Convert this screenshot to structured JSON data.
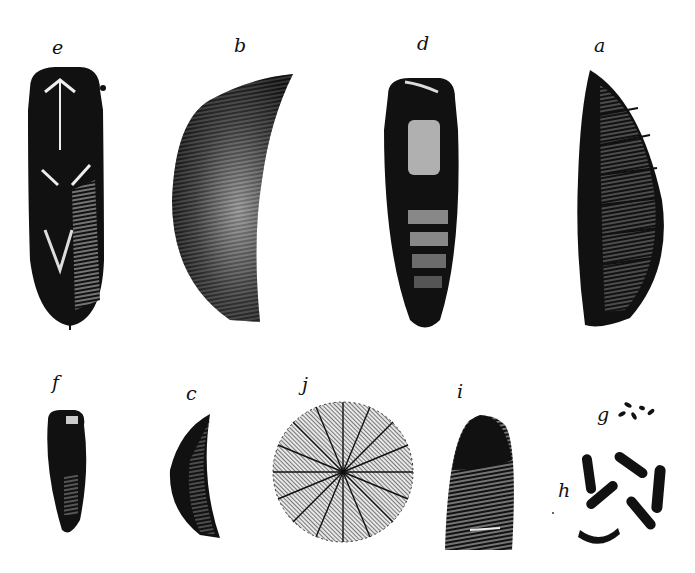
{
  "plate": {
    "background": "#ffffff",
    "ink": "#111111",
    "figures": [
      {
        "id": "e",
        "label": "e",
        "description": "pupa, ventral view with wing cases and legs"
      },
      {
        "id": "b",
        "label": "b",
        "description": "curved puparium, side view"
      },
      {
        "id": "d",
        "label": "d",
        "description": "pupa, dorsal view"
      },
      {
        "id": "a",
        "label": "a",
        "description": "segmented puparium, side view"
      },
      {
        "id": "f",
        "label": "f",
        "description": "small pupa"
      },
      {
        "id": "c",
        "label": "c",
        "description": "small curved puparium"
      },
      {
        "id": "j",
        "label": "j",
        "description": "magnified circular surface texture"
      },
      {
        "id": "i",
        "label": "i",
        "description": "magnified end of puparium"
      },
      {
        "id": "g",
        "label": "g",
        "description": "eggs, natural size"
      },
      {
        "id": "h",
        "label": "h",
        "description": "eggs, magnified"
      }
    ]
  }
}
